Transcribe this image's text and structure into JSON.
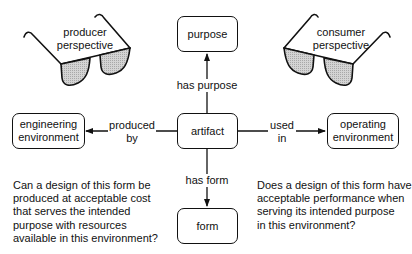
{
  "diagram": {
    "nodes": {
      "purpose": {
        "label": "purpose"
      },
      "artifact": {
        "label": "artifact"
      },
      "form": {
        "label": "form"
      },
      "engineering": {
        "line1": "engineering",
        "line2": "environment"
      },
      "operating": {
        "line1": "operating",
        "line2": "environment"
      }
    },
    "edges": {
      "has_purpose": {
        "label": "has purpose",
        "from": "artifact",
        "to": "purpose"
      },
      "has_form": {
        "label": "has form",
        "from": "artifact",
        "to": "form"
      },
      "produced_by": {
        "line1": "produced",
        "line2": "by",
        "from": "artifact",
        "to": "engineering"
      },
      "used_in": {
        "line1": "used",
        "line2": "in",
        "from": "artifact",
        "to": "operating"
      }
    },
    "perspectives": {
      "producer": {
        "line1": "producer",
        "line2": "perspective"
      },
      "consumer": {
        "line1": "consumer",
        "line2": "perspective"
      }
    },
    "questions": {
      "producer": [
        "Can a design of this form be",
        "produced at acceptable cost",
        "that serves the intended",
        "purpose with resources",
        "available in this environment?"
      ],
      "consumer": [
        "Does a design of this form have",
        "acceptable performance when",
        "serving its intended purpose",
        "in this environment?"
      ]
    },
    "colors": {
      "stroke": "#111111",
      "lens_fill": "#c8c8c8",
      "background": "#ffffff"
    }
  }
}
